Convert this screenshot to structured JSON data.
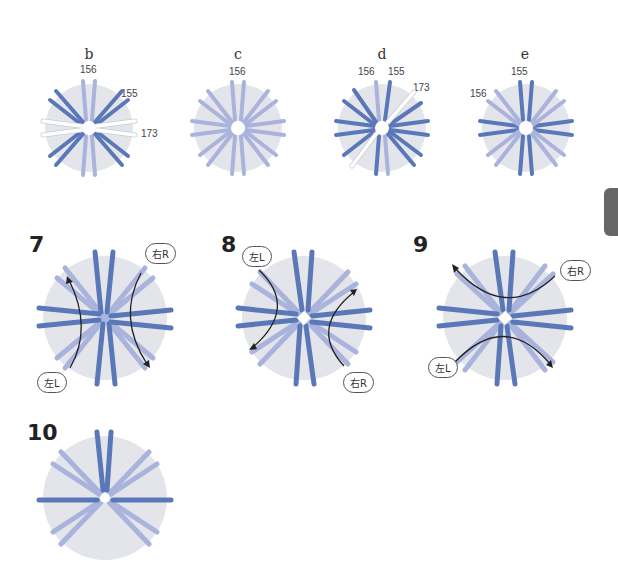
{
  "colors": {
    "disc": "#e3e5ea",
    "dark_strand": "#5a78b8",
    "light_strand": "#a9b3dc",
    "white_strand": "#ffffff",
    "arrow": "#222222",
    "side_tab": "#666666"
  },
  "small_diagrams": [
    {
      "id": "b",
      "label": "b",
      "numbers": [
        "156",
        "155",
        "173"
      ]
    },
    {
      "id": "c",
      "label": "c",
      "numbers": [
        "156"
      ]
    },
    {
      "id": "d",
      "label": "d",
      "numbers": [
        "156",
        "155",
        "173"
      ]
    },
    {
      "id": "e",
      "label": "e",
      "numbers": [
        "155",
        "156"
      ]
    }
  ],
  "steps": [
    {
      "number": "7",
      "bubbles": [
        "右R",
        "左L"
      ]
    },
    {
      "number": "8",
      "bubbles": [
        "左L",
        "右R"
      ]
    },
    {
      "number": "9",
      "bubbles": [
        "右R",
        "左L"
      ]
    },
    {
      "number": "10",
      "bubbles": []
    }
  ]
}
